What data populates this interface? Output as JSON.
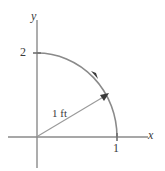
{
  "figure": {
    "name": "quarter-arc-coordinate-diagram",
    "width": 165,
    "height": 171,
    "background_color": "#ffffff",
    "stroke_color": "#8a8a8a",
    "text_color": "#3a3a3a"
  },
  "axes": {
    "y_label": "y",
    "x_label": "x",
    "origin": {
      "x": 37,
      "y": 137
    },
    "y_axis": {
      "x": 37,
      "y_top": 20,
      "y_bottom": 168
    },
    "x_axis": {
      "y": 137,
      "x_left": 8,
      "x_right": 148
    }
  },
  "ticks": {
    "y": [
      {
        "label": "2",
        "x": 37,
        "y": 53
      }
    ],
    "x": [
      {
        "label": "1",
        "x": 117,
        "y": 137
      }
    ]
  },
  "arc": {
    "start": {
      "x": 37,
      "y": 53
    },
    "end": {
      "x": 117,
      "y": 137
    },
    "rx": 80,
    "ry": 84,
    "direction_arrow_at": {
      "x": 94,
      "y": 76
    }
  },
  "radius_arrow": {
    "label": "1 ft",
    "from": {
      "x": 38,
      "y": 136
    },
    "to": {
      "x": 108,
      "y": 94
    }
  }
}
